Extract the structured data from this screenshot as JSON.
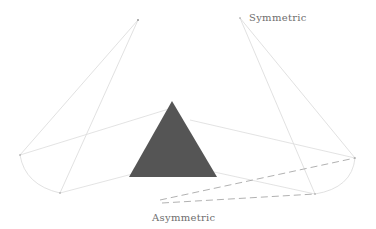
{
  "diagram": {
    "labels": {
      "symmetric": "Symmetric",
      "asymmetric": "Asymmetric"
    },
    "colors": {
      "background": "#ffffff",
      "triangle_fill": "#555555",
      "thin_lines": "#d6d6d6",
      "dashed_lines": "#a8a8a8",
      "label_text": "#6e6e6e"
    },
    "shapes": {
      "triangle": {
        "points": [
          [
            172,
            101
          ],
          [
            129,
            177
          ],
          [
            217,
            177
          ]
        ]
      },
      "left_apex": [
        138,
        20
      ],
      "right_apex": [
        240,
        18
      ],
      "left_arc": {
        "from": [
          20,
          155
        ],
        "to": [
          60,
          193
        ]
      },
      "right_arc": {
        "from": [
          355,
          158
        ],
        "to": [
          315,
          194
        ]
      },
      "dashed_origin": [
        160,
        200
      ]
    }
  }
}
